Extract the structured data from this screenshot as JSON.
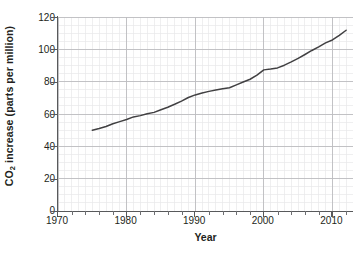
{
  "chart_data": {
    "type": "line",
    "title": "",
    "xlabel": "Year",
    "ylabel": "CO2 increase (parts per million)",
    "ylabel_prefix": "CO",
    "ylabel_subscript": "2",
    "ylabel_suffix": " increase (parts per million)",
    "xlim": [
      1970,
      2013
    ],
    "ylim": [
      0,
      120
    ],
    "grid": true,
    "grid_major_color": "#bcbdc0",
    "grid_minor_color": "#e8e8ea",
    "line_color": "#414042",
    "legend": null,
    "legend_position": "none",
    "xticks": [
      1970,
      1980,
      1990,
      2000,
      2010
    ],
    "xtick_labels": [
      "1970",
      "1980",
      "1990",
      "2000",
      "2010"
    ],
    "xminor_tick_step": 2,
    "yticks": [
      0,
      20,
      40,
      60,
      80,
      100,
      120
    ],
    "ytick_labels": [
      "0",
      "20",
      "40",
      "60",
      "80",
      "100",
      "120"
    ],
    "yminor_gridline_step": 5,
    "x": [
      1975,
      1976,
      1977,
      1978,
      1979,
      1980,
      1981,
      1982,
      1983,
      1984,
      1985,
      1986,
      1987,
      1988,
      1989,
      1990,
      1991,
      1992,
      1993,
      1994,
      1995,
      1996,
      1997,
      1998,
      1999,
      2000,
      2001,
      2002,
      2003,
      2004,
      2005,
      2006,
      2007,
      2008,
      2009,
      2010,
      2011,
      2012
    ],
    "values": [
      50.0,
      51.0,
      52.3,
      54.0,
      55.3,
      56.6,
      58.2,
      59.0,
      60.2,
      61.0,
      62.6,
      64.2,
      66.0,
      68.0,
      70.2,
      71.8,
      73.0,
      74.0,
      74.8,
      75.6,
      76.2,
      78.0,
      79.8,
      81.5,
      84.0,
      87.3,
      87.8,
      88.5,
      90.2,
      92.2,
      94.4,
      96.8,
      99.3,
      101.5,
      104.0,
      105.8,
      108.6,
      111.8
    ],
    "series_name": "CO2 increase"
  },
  "axis": {
    "y_title_prefix": "CO",
    "y_title_sub": "2",
    "y_title_rest": " increase (parts per million)",
    "x_title": "Year"
  }
}
